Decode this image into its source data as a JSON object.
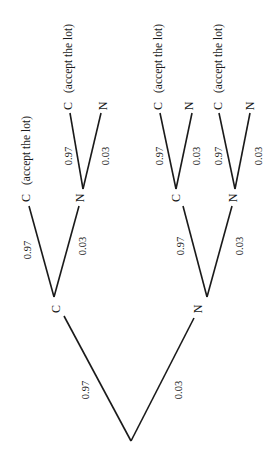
{
  "diagram": {
    "type": "probability-tree",
    "orientation": "rotated-90-ccw",
    "root": {
      "branches": [
        {
          "prob": "0.97",
          "node": "C",
          "branches": [
            {
              "prob": "0.97",
              "node": "C",
              "note": "(accept the lot)"
            },
            {
              "prob": "0.03",
              "node": "N",
              "branches": [
                {
                  "prob": "0.97",
                  "node": "C",
                  "note": "(accept the lot)"
                },
                {
                  "prob": "0.03",
                  "node": "N"
                }
              ]
            }
          ]
        },
        {
          "prob": "0.03",
          "node": "N",
          "branches": [
            {
              "prob": "0.97",
              "node": "C",
              "branches": [
                {
                  "prob": "0.97",
                  "node": "C",
                  "note": "(accept the lot)"
                },
                {
                  "prob": "0.03",
                  "node": "N"
                }
              ]
            },
            {
              "prob": "0.03",
              "node": "N",
              "branches": [
                {
                  "prob": "0.97",
                  "node": "C",
                  "note": "(accept the lot)"
                },
                {
                  "prob": "0.03",
                  "node": "N"
                }
              ]
            }
          ]
        }
      ]
    }
  },
  "labels": {
    "l1_c": "C",
    "l1_n": "N",
    "l1_c_prob": "0.97",
    "l1_n_prob": "0.03",
    "a_c": "C",
    "a_c_note": "(accept the lot)",
    "a_c_prob": "0.97",
    "a_n": "N",
    "a_n_prob": "0.03",
    "an_c": "C",
    "an_c_note": "(accept the lot)",
    "an_c_prob": "0.97",
    "an_n": "N",
    "an_n_prob": "0.03",
    "b_c": "C",
    "b_c_prob": "0.97",
    "b_n": "N",
    "b_n_prob": "0.03",
    "bc_c": "C",
    "bc_c_note": "(accept the lot)",
    "bc_c_prob": "0.97",
    "bc_n": "N",
    "bc_n_prob": "0.03",
    "bn_c": "C",
    "bn_c_note": "(accept the lot)",
    "bn_c_prob": "0.97",
    "bn_n": "N",
    "bn_n_prob": "0.03"
  }
}
